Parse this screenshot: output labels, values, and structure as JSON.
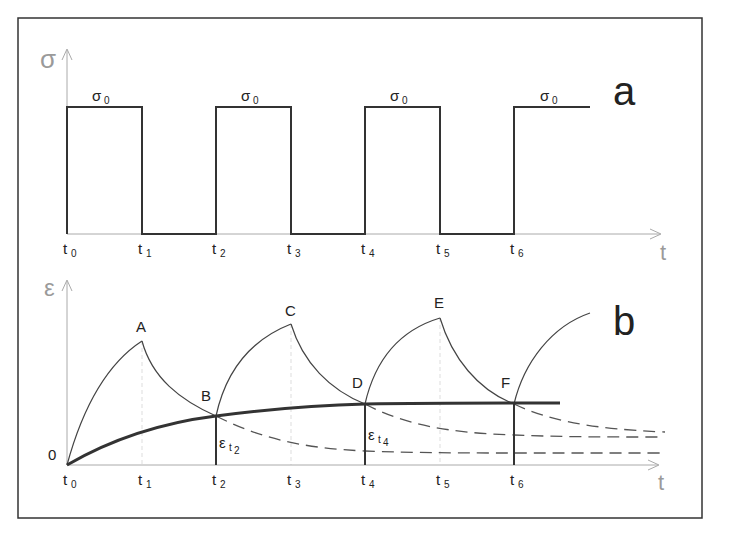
{
  "figure": {
    "panels": [
      {
        "id": "a",
        "letter": "a",
        "y_axis_symbol": "σ",
        "x_axis_symbol": "t",
        "level_symbol": "σ",
        "level_subscript": "0",
        "description": "Rectangular cyclic stress: σ0 applied on intervals t0–t1, t2–t3, t4–t5, t6–",
        "time_ticks": [
          {
            "base": "t",
            "sub": "0"
          },
          {
            "base": "t",
            "sub": "1"
          },
          {
            "base": "t",
            "sub": "2"
          },
          {
            "base": "t",
            "sub": "3"
          },
          {
            "base": "t",
            "sub": "4"
          },
          {
            "base": "t",
            "sub": "5"
          },
          {
            "base": "t",
            "sub": "6"
          }
        ]
      },
      {
        "id": "b",
        "letter": "b",
        "y_axis_symbol": "ε",
        "x_axis_symbol": "t",
        "origin_label": "0",
        "description": "Strain response: creep loading/unloading curves with peaks A, C, E and troughs B, D, F; thick envelope of residual strain; dashed recovery curves",
        "points": [
          "A",
          "B",
          "C",
          "D",
          "E",
          "F"
        ],
        "residual_labels": [
          {
            "base": "ε",
            "sub": "t",
            "subsub": "2"
          },
          {
            "base": "ε",
            "sub": "t",
            "subsub": "4"
          }
        ],
        "time_ticks": [
          {
            "base": "t",
            "sub": "0"
          },
          {
            "base": "t",
            "sub": "1"
          },
          {
            "base": "t",
            "sub": "2"
          },
          {
            "base": "t",
            "sub": "3"
          },
          {
            "base": "t",
            "sub": "4"
          },
          {
            "base": "t",
            "sub": "5"
          },
          {
            "base": "t",
            "sub": "6"
          }
        ]
      }
    ]
  }
}
